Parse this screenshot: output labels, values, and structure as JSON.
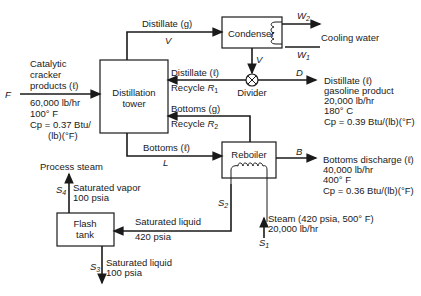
{
  "units": {
    "distillation_tower": {
      "line1": "Distillation",
      "line2": "tower"
    },
    "condenser": {
      "label": "Condenser"
    },
    "divider": {
      "label": "Divider"
    },
    "reboiler": {
      "label": "Reboiler"
    },
    "flash_tank": {
      "line1": "Flash",
      "line2": "tank"
    }
  },
  "streams": {
    "feed": {
      "symbol": "F",
      "lines": [
        "Catalytic",
        "cracker",
        "products (ℓ)"
      ],
      "props": [
        "60,000 lb/hr",
        "100° F",
        "Cp = 0.37 Btu/",
        "(lb)(°F)"
      ]
    },
    "distillate_g": {
      "label": "Distillate (g)",
      "symbol": "V"
    },
    "condenser_out": {
      "symbol": "V"
    },
    "cooling_water": {
      "label": "Cooling water",
      "in": "W1",
      "out": "W2"
    },
    "recycle_1": {
      "label": "Distillate (ℓ)",
      "recycle": "Recycle R1"
    },
    "distillate_product": {
      "symbol": "D",
      "lines": [
        "Distillate (ℓ)",
        "gasoline product",
        "20,000 lb/hr",
        "180° C",
        "Cp = 0.39 Btu/(lb)(°F)"
      ]
    },
    "recycle_2": {
      "label": "Bottoms (g)",
      "recycle": "Recycle R2"
    },
    "bottoms_l": {
      "label": "Bottoms (ℓ)",
      "symbol": "L"
    },
    "bottoms_discharge": {
      "symbol": "B",
      "lines": [
        "Bottoms discharge (ℓ)",
        "40,000 lb/hr",
        "400° F",
        "Cp = 0.36 Btu/(lb)(°F)"
      ]
    },
    "steam_in": {
      "symbol": "S1",
      "lines": [
        "Steam (420 psia, 500° F)",
        "20,000 lb/hr"
      ]
    },
    "reboiler_condensate": {
      "symbol": "S2",
      "lines": [
        "Saturated liquid",
        "420 psia"
      ]
    },
    "flash_vapor": {
      "symbol": "S4",
      "dest": "Process steam",
      "lines": [
        "Saturated vapor",
        "100 psia"
      ]
    },
    "flash_liquid": {
      "symbol": "S3",
      "lines": [
        "Saturated liquid",
        "100 psia"
      ]
    }
  }
}
